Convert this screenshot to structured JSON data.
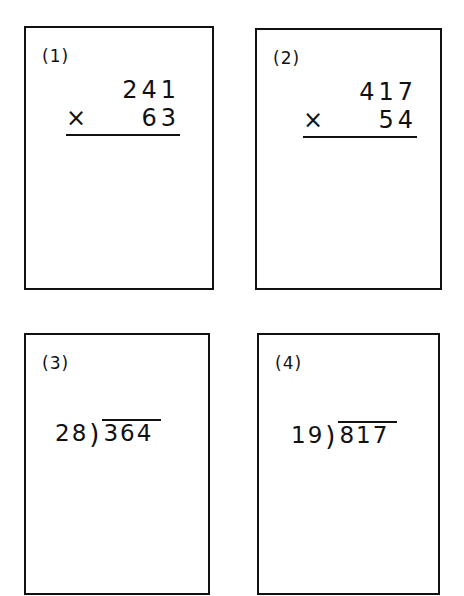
{
  "problems": [
    {
      "label": "(1)",
      "type": "multiplication",
      "multiplicand": "241",
      "operator": "×",
      "multiplier": "63"
    },
    {
      "label": "(2)",
      "type": "multiplication",
      "multiplicand": "417",
      "operator": "×",
      "multiplier": "54"
    },
    {
      "label": "(3)",
      "type": "long-division",
      "divisor": "28",
      "dividend": "364"
    },
    {
      "label": "(4)",
      "type": "long-division",
      "divisor": "19",
      "dividend": "817"
    }
  ]
}
